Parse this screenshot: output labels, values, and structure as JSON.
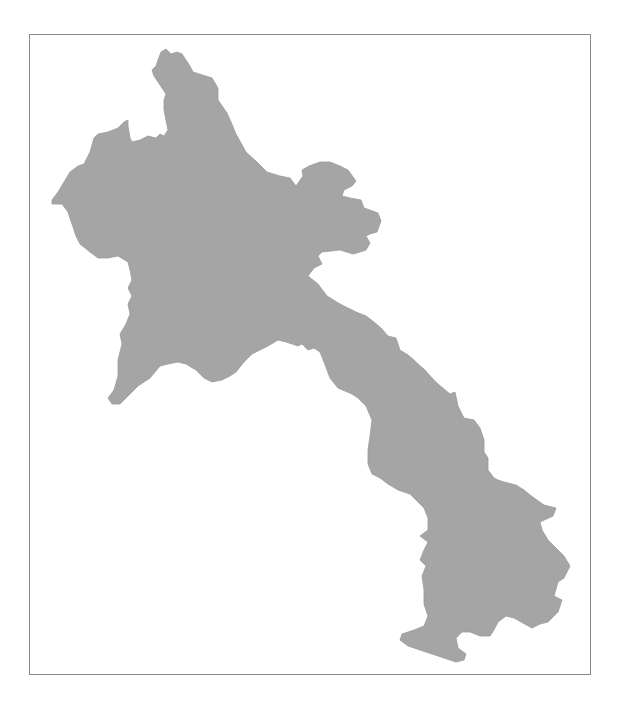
{
  "map": {
    "country": "Laos",
    "fill_color": "#a5a5a5",
    "frame_color": "#8a8a8a",
    "background_color": "#ffffff"
  }
}
